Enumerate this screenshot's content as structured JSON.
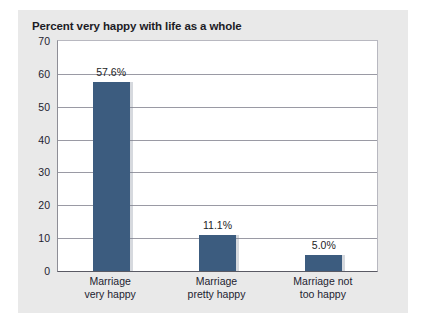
{
  "chart_data": {
    "type": "bar",
    "title": "Percent very happy with life as a whole",
    "xlabel": "",
    "ylabel": "",
    "ylim": [
      0,
      70
    ],
    "ytick_step": 10,
    "yticks": [
      70,
      60,
      50,
      40,
      30,
      20,
      10,
      0
    ],
    "grid": true,
    "legend": "none",
    "categories": [
      "Marriage\nvery happy",
      "Marriage\npretty happy",
      "Marriage not\ntoo happy"
    ],
    "category_lines": [
      [
        "Marriage",
        "very happy"
      ],
      [
        "Marriage",
        "pretty happy"
      ],
      [
        "Marriage not",
        "too happy"
      ]
    ],
    "values": [
      57.6,
      11.1,
      5.0
    ],
    "data_labels": [
      "57.6%",
      "11.1%",
      "5.0%"
    ],
    "bar_color": "#3c5c7f",
    "plot_background": "#ffffff",
    "panel_background": "#e9e9e9",
    "gridline_color": "#9a9aa4",
    "text_color": "#232330"
  }
}
